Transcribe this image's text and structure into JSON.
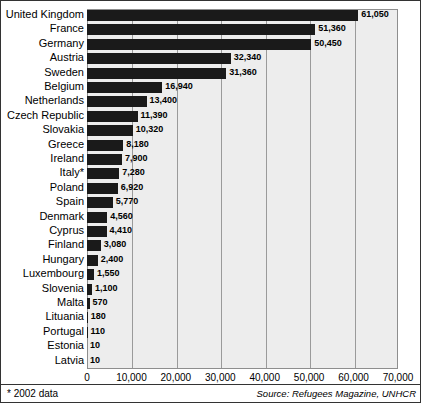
{
  "chart_data": {
    "type": "bar",
    "orientation": "horizontal",
    "title": "",
    "xlabel": "",
    "ylabel": "",
    "xlim": [
      0,
      70000
    ],
    "xticks": [
      "0",
      "10,000",
      "20,000",
      "30,000",
      "40,000",
      "50,000",
      "60,000",
      "70,000"
    ],
    "xtick_values": [
      0,
      10000,
      20000,
      30000,
      40000,
      50000,
      60000,
      70000
    ],
    "grid": true,
    "grid_axis": "x",
    "legend": false,
    "categories": [
      "United Kingdom",
      "France",
      "Germany",
      "Austria",
      "Sweden",
      "Belgium",
      "Netherlands",
      "Czech Republic",
      "Slovakia",
      "Greece",
      "Ireland",
      "Italy*",
      "Poland",
      "Spain",
      "Denmark",
      "Cyprus",
      "Finland",
      "Hungary",
      "Luxembourg",
      "Slovenia",
      "Malta",
      "Lituania",
      "Portugal",
      "Estonia",
      "Latvia"
    ],
    "values": [
      61050,
      51360,
      50450,
      32340,
      31360,
      16940,
      13400,
      11390,
      10320,
      8180,
      7900,
      7280,
      6920,
      5770,
      4560,
      4410,
      3080,
      2400,
      1550,
      1100,
      570,
      180,
      110,
      10,
      10
    ],
    "value_labels": [
      "61,050",
      "51,360",
      "50,450",
      "32,340",
      "31,360",
      "16,940",
      "13,400",
      "11,390",
      "10,320",
      "8,180",
      "7,900",
      "7,280",
      "6,920",
      "5,770",
      "4,560",
      "4,410",
      "3,080",
      "2,400",
      "1,550",
      "1,100",
      "570",
      "180",
      "110",
      "10",
      "10"
    ],
    "bar_color": "#1a1a1a",
    "plot_background": "#ededed"
  },
  "footer": {
    "footnote": "* 2002 data",
    "source": "Source: Refugees Magazine, UNHCR"
  }
}
